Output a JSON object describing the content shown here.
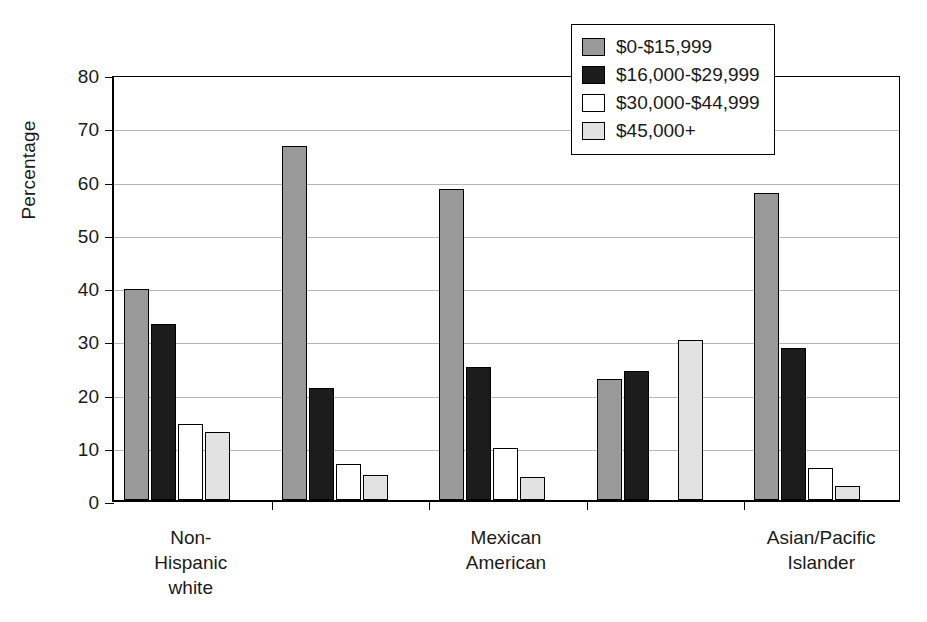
{
  "chart_data": {
    "type": "bar",
    "title": "",
    "xlabel": "",
    "ylabel": "Percentage",
    "ylim": [
      0,
      80
    ],
    "yticks": [
      0,
      10,
      20,
      30,
      40,
      50,
      60,
      70,
      80
    ],
    "grid": true,
    "legend_position": "top-right",
    "categories": [
      "Non-\nHispanic\nwhite",
      "",
      "Mexican\nAmerican",
      "",
      "Asian/Pacific\nIslander"
    ],
    "visible_category_labels": [
      {
        "text": "Non-\nHispanic\nwhite",
        "group_index": 0
      },
      {
        "text": "Mexican\nAmerican",
        "group_index": 2
      },
      {
        "text": "Asian/Pacific\nIslander",
        "group_index": 4
      }
    ],
    "series": [
      {
        "name": "$0-$15,999",
        "color": "#999999",
        "values": [
          39.7,
          66.4,
          58.5,
          22.7,
          57.6
        ]
      },
      {
        "name": "$16,000-$29,999",
        "color": "#1c1c1c",
        "values": [
          33.0,
          21.1,
          25.0,
          24.2,
          28.5
        ]
      },
      {
        "name": "$30,000-$44,999",
        "color": "#ffffff",
        "values": [
          14.2,
          6.8,
          9.8,
          0.0,
          6.0
        ]
      },
      {
        "name": "$45,000+",
        "color": "#e2e2e2",
        "values": [
          12.8,
          4.7,
          4.3,
          30.1,
          2.6
        ]
      }
    ]
  },
  "legend": {
    "items": [
      {
        "label": "$0-$15,999"
      },
      {
        "label": "$16,000-$29,999"
      },
      {
        "label": "$30,000-$44,999"
      },
      {
        "label": "$45,000+"
      }
    ]
  },
  "axes": {
    "y_title": "Percentage",
    "y_tick_labels": [
      "0",
      "10",
      "20",
      "30",
      "40",
      "50",
      "60",
      "70",
      "80"
    ]
  }
}
